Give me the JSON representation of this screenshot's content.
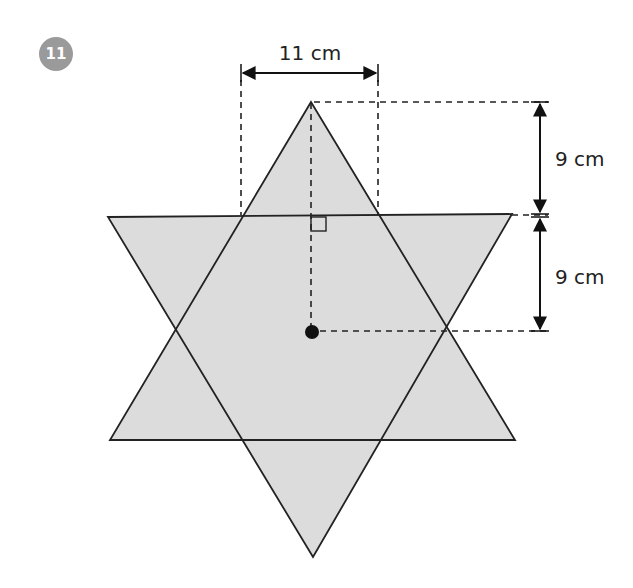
{
  "problem": {
    "number": "11",
    "badge_color": "#9a9a9a"
  },
  "figure": {
    "shape": "hexagram (six-pointed star) formed by two overlapping equilateral triangles",
    "fill_color": "#dcdcdc",
    "stroke_color": "#222222",
    "labels": {
      "width": "11 cm",
      "upper_height": "9 cm",
      "lower_height": "9 cm"
    },
    "annotations": [
      "right-angle-marker",
      "center-point",
      "dashed-guides"
    ]
  }
}
